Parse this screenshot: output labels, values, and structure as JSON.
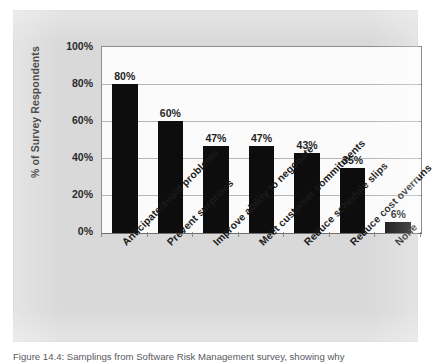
{
  "figure": {
    "caption": "Figure 14.4: Samplings from Software Risk Management survey, showing why",
    "background_color": "#d9d9d9",
    "plot_background_color": "#fbfbfb",
    "bar_color": "#0d0d0d",
    "gridline_color": "#b6b6b6"
  },
  "chart_data": {
    "type": "bar",
    "title": "",
    "xlabel": "",
    "ylabel": "% of Survey Respondents",
    "categories": [
      "Anticipate/avoid problems",
      "Prevent surprises",
      "Improve ability to negotiate",
      "Meet customer commitments",
      "Reduce schedule slips",
      "Reduce cost overruns",
      "None"
    ],
    "values": [
      80,
      60,
      47,
      47,
      43,
      35,
      6
    ],
    "value_labels": [
      "80%",
      "60%",
      "47%",
      "47%",
      "43%",
      "35%",
      "6%"
    ],
    "ylim": [
      0,
      100
    ],
    "ytick_values": [
      100,
      80,
      60,
      40,
      20,
      0
    ],
    "ytick_labels": [
      "100%",
      "80%",
      "60%",
      "40%",
      "20%",
      "0%"
    ],
    "grid": "horizontal",
    "legend": "none"
  }
}
